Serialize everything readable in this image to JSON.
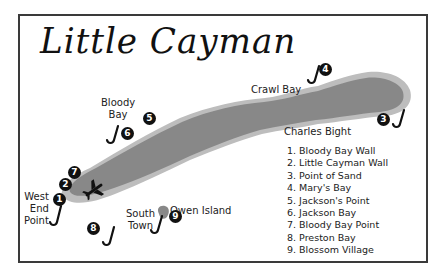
{
  "title": "Little Cayman",
  "colors": {
    "island_fill": "#888888",
    "reef_fill": "#bdbdbd",
    "frame": "#3a3a3a",
    "marker": "#111111"
  },
  "place_labels": {
    "bloody_bay": "Bloody\nBay",
    "bloody_bay_line1": "Bloody",
    "bloody_bay_line2": "Bay",
    "crawl_bay": "Crawl Bay",
    "charles_bight": "Charles Bight",
    "west_end_line1": "West",
    "west_end_line2": "End",
    "west_end_line3": "Point",
    "owen_island": "Owen Island",
    "south_town_line1": "South",
    "south_town_line2": "Town"
  },
  "markers": [
    "1",
    "2",
    "3",
    "4",
    "5",
    "6",
    "7",
    "8",
    "9"
  ],
  "icons": {
    "dive_site": "anchor-hook-icon",
    "airport": "airplane-icon"
  },
  "legend": {
    "items": [
      "1. Bloody Bay Wall",
      "2. Little Cayman Wall",
      "3. Point of Sand",
      "4. Mary's Bay",
      "5. Jackson's Point",
      "6. Jackson Bay",
      "7. Bloody Bay Point",
      "8. Preston Bay",
      "9. Blossom Village"
    ]
  }
}
